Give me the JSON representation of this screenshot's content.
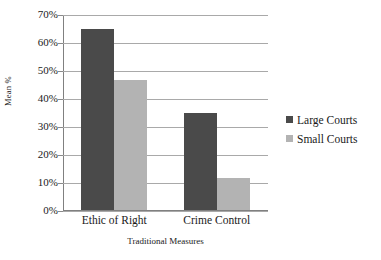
{
  "chart_data": {
    "type": "bar",
    "title": "",
    "subtitle": "",
    "xlabel": "Traditional Measures",
    "ylabel": "Mean %",
    "categories": [
      "Ethic of Right",
      "Crime Control"
    ],
    "series": [
      {
        "name": "Large Courts",
        "values": [
          64.5,
          34.5
        ],
        "color": "#4a4a4a"
      },
      {
        "name": "Small Courts",
        "values": [
          46.5,
          11.5
        ],
        "color": "#b3b3b3"
      }
    ],
    "ylim": [
      0,
      70
    ],
    "ytick_step": 10,
    "ytick_labels": [
      "70%",
      "60%",
      "50%",
      "40%",
      "30%",
      "20%",
      "10%",
      "0%"
    ],
    "ytick_values": [
      70,
      60,
      50,
      40,
      30,
      20,
      10,
      0
    ],
    "grid": true,
    "grid_axis": "y",
    "legend_position": "right",
    "value_format": "percent"
  },
  "legend": {
    "items": [
      {
        "label": "Large Courts",
        "color": "#4a4a4a"
      },
      {
        "label": "Small Courts",
        "color": "#b3b3b3"
      }
    ]
  },
  "colors": {
    "large_courts": "#4a4a4a",
    "small_courts": "#b3b3b3",
    "gridline": "#a9a9a9",
    "axis": "#808080",
    "text": "#1a1a1a",
    "background": "#ffffff"
  }
}
